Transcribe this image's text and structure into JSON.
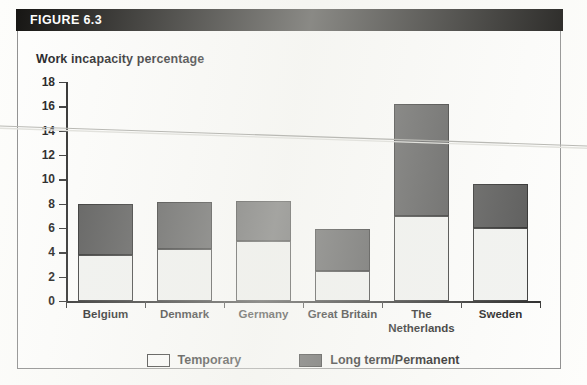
{
  "figure": {
    "header_label": "FIGURE 6.3",
    "chart_title": "Work incapacity percentage"
  },
  "legend": {
    "items": [
      {
        "label": "Temporary",
        "color": "#ffffff",
        "icon": "legend-swatch-temporary"
      },
      {
        "label": "Long term/Permanent",
        "color": "#4a4a4a",
        "icon": "legend-swatch-long-term"
      }
    ]
  },
  "chart_data": {
    "type": "bar",
    "subtype": "stacked",
    "title": "Work incapacity percentage",
    "xlabel": "",
    "ylabel": "Work incapacity percentage",
    "ylim": [
      0,
      18
    ],
    "yticks": [
      0,
      2,
      4,
      6,
      8,
      10,
      12,
      14,
      16,
      18
    ],
    "ytick_labels": [
      "0",
      "2",
      "4",
      "6",
      "8",
      "10",
      "12",
      "14",
      "16",
      "18"
    ],
    "grid": false,
    "legend_position": "bottom",
    "categories": [
      "Belgium",
      "Denmark",
      "Germany",
      "Great Britain",
      "The\nNetherlands",
      "Sweden"
    ],
    "series": [
      {
        "name": "Temporary",
        "color": "#f2f3f1",
        "values": [
          3.8,
          4.3,
          4.9,
          2.5,
          7.0,
          6.0
        ]
      },
      {
        "name": "Long term/Permanent",
        "color": "#4a4a4a",
        "values": [
          4.2,
          3.8,
          3.3,
          3.4,
          9.2,
          3.6
        ]
      }
    ],
    "totals": [
      8.0,
      8.1,
      8.2,
      5.9,
      16.2,
      9.6
    ]
  }
}
